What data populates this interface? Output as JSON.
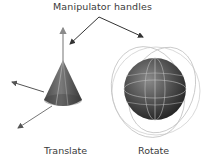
{
  "title": "Manipulator handles",
  "labels": {
    "translate": "Translate",
    "rotate": "Rotate"
  },
  "colors": {
    "text": "#3a3a3a",
    "callout_arrow": "#333333",
    "axis_arrow": "#8a8a8a",
    "cone_dark": "#3c3c3c",
    "cone_light": "#8c8c8c",
    "sphere_dark": "#2e2e2e",
    "sphere_light": "#7a7a7a",
    "rotate_rings": "#c8c8c8"
  },
  "objects": [
    {
      "name": "cone",
      "manipulator": "translate"
    },
    {
      "name": "sphere",
      "manipulator": "rotate"
    }
  ]
}
